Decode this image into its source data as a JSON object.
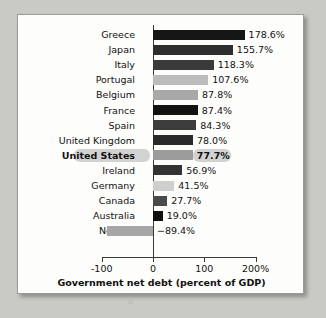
{
  "chart_data": {
    "type": "bar",
    "orientation": "horizontal",
    "title": "",
    "xlabel": "Government net debt (percent of GDP)",
    "ylabel": "",
    "xlim": [
      -100,
      200
    ],
    "xticks": [
      -100,
      0,
      100,
      200
    ],
    "xtick_labels": [
      "-100",
      "0",
      "100",
      "200%"
    ],
    "grid": false,
    "legend": null,
    "highlight": "United States",
    "categories": [
      "Greece",
      "Japan",
      "Italy",
      "Portugal",
      "Belgium",
      "France",
      "Spain",
      "United Kingdom",
      "United States",
      "Ireland",
      "Germany",
      "Canada",
      "Australia",
      "Norway"
    ],
    "values": [
      178.6,
      155.7,
      118.3,
      107.6,
      87.8,
      87.4,
      84.3,
      78.0,
      77.7,
      56.9,
      41.5,
      27.7,
      19.0,
      -89.4
    ],
    "value_labels": [
      "178.6%",
      "155.7%",
      "118.3%",
      "107.6%",
      "87.8%",
      "87.4%",
      "84.3%",
      "78.0%",
      "77.7%",
      "56.9%",
      "41.5%",
      "27.7%",
      "19.0%",
      "−89.4%"
    ],
    "bar_colors": [
      "#161616",
      "#2e2e2e",
      "#3a3a3a",
      "#bcbcbc",
      "#a8a8a8",
      "#121212",
      "#3c3c3c",
      "#2a2a2a",
      "#9c9c9c",
      "#333333",
      "#cfcfcf",
      "#4a4a4a",
      "#101010",
      "#a6a6a6"
    ]
  },
  "style": {
    "panel_bg": "#fdfdfb",
    "page_bg": "#c9c9c5",
    "axis_color": "#3a3a3a",
    "highlight_color": "#d2d2d2",
    "text_color": "#111111"
  }
}
